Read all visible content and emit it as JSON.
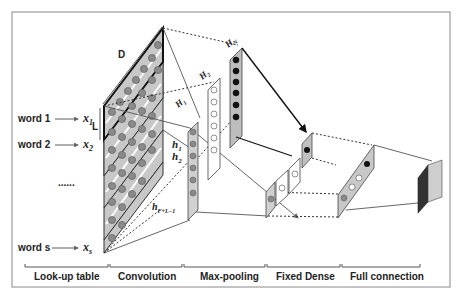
{
  "diagram": {
    "type": "cnn-text-classification-architecture",
    "inputs": [
      {
        "word": "word 1",
        "vector": "x",
        "sub": "1"
      },
      {
        "word": "word 2",
        "vector": "x",
        "sub": "2"
      },
      {
        "word": "......",
        "vector": "",
        "sub": ""
      },
      {
        "word": "word s",
        "vector": "x",
        "sub": "s"
      }
    ],
    "dimension_labels": {
      "D": "D",
      "L": "L"
    },
    "feature_maps": {
      "H1": {
        "base": "H",
        "sub": "1"
      },
      "H2": {
        "base": "H",
        "sub": "2"
      },
      "HN": {
        "base": "H",
        "sub": "N"
      }
    },
    "hidden_units": {
      "h1": {
        "base": "h",
        "sub": "1"
      },
      "h2": {
        "base": "h",
        "sub": "2"
      },
      "hlast": {
        "base": "h",
        "sub": "F+L−1"
      }
    },
    "stages": [
      {
        "label": "Look-up table"
      },
      {
        "label": "Convolution"
      },
      {
        "label": "Max-pooling"
      },
      {
        "label": "Fixed Dense"
      },
      {
        "label": "Full connection"
      }
    ],
    "colors": {
      "panel_fill": "#c8c8c8",
      "node_fill": "#8a8a8a",
      "node_dark": "#111111",
      "line": "#555555",
      "frame": "#888888"
    }
  }
}
